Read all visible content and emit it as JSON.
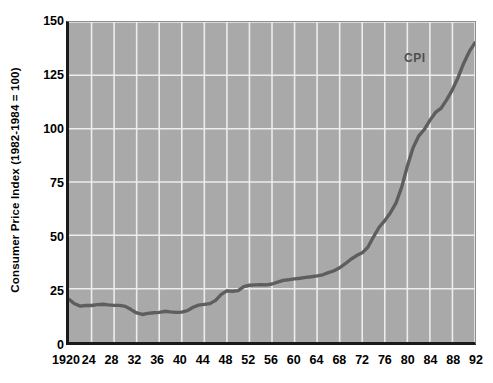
{
  "chart_data": {
    "type": "line",
    "title": "",
    "xlabel": "",
    "ylabel": "Consumer Price Index (1982-1984 = 100)",
    "xlim": [
      1920,
      1992
    ],
    "ylim": [
      0,
      150
    ],
    "grid": true,
    "legend_position": "inline-right",
    "series": [
      {
        "name": "CPI",
        "color": "#5e5e5e",
        "x": [
          1920,
          1921,
          1922,
          1923,
          1924,
          1925,
          1926,
          1927,
          1928,
          1929,
          1930,
          1931,
          1932,
          1933,
          1934,
          1935,
          1936,
          1937,
          1938,
          1939,
          1940,
          1941,
          1942,
          1943,
          1944,
          1945,
          1946,
          1947,
          1948,
          1949,
          1950,
          1951,
          1952,
          1953,
          1954,
          1955,
          1956,
          1957,
          1958,
          1959,
          1960,
          1961,
          1962,
          1963,
          1964,
          1965,
          1966,
          1967,
          1968,
          1969,
          1970,
          1971,
          1972,
          1973,
          1974,
          1975,
          1976,
          1977,
          1978,
          1979,
          1980,
          1981,
          1982,
          1983,
          1984,
          1985,
          1986,
          1987,
          1988,
          1989,
          1990,
          1991,
          1992
        ],
        "values": [
          20.0,
          17.9,
          16.8,
          17.1,
          17.1,
          17.5,
          17.7,
          17.4,
          17.2,
          17.2,
          16.7,
          15.2,
          13.6,
          12.9,
          13.4,
          13.7,
          13.9,
          14.4,
          14.1,
          13.9,
          14.0,
          14.7,
          16.3,
          17.3,
          17.6,
          18.0,
          19.5,
          22.3,
          24.0,
          23.8,
          24.1,
          26.0,
          26.6,
          26.8,
          26.9,
          26.8,
          27.2,
          28.1,
          28.9,
          29.2,
          29.6,
          29.9,
          30.3,
          30.6,
          31.0,
          31.5,
          32.5,
          33.4,
          34.8,
          36.7,
          38.8,
          40.5,
          41.8,
          44.4,
          49.3,
          53.8,
          56.9,
          60.6,
          65.2,
          72.6,
          82.4,
          90.9,
          96.5,
          99.6,
          103.9,
          107.6,
          109.6,
          113.6,
          118.3,
          124.0,
          130.7,
          136.2,
          140.3
        ]
      }
    ],
    "ytick_labels": [
      "0",
      "25",
      "50",
      "75",
      "100",
      "125",
      "150"
    ],
    "ytick_values": [
      0,
      25,
      50,
      75,
      100,
      125,
      150
    ],
    "xtick_labels": [
      "1920",
      "24",
      "28",
      "32",
      "36",
      "40",
      "44",
      "48",
      "52",
      "56",
      "60",
      "64",
      "68",
      "72",
      "76",
      "80",
      "84",
      "88",
      "92"
    ],
    "xtick_values": [
      1920,
      1924,
      1928,
      1932,
      1936,
      1940,
      1944,
      1948,
      1952,
      1956,
      1960,
      1964,
      1968,
      1972,
      1976,
      1980,
      1984,
      1988,
      1992
    ],
    "annotations": [
      {
        "text": "CPI",
        "x": 1982,
        "y": 133
      }
    ],
    "colors": {
      "plot_background": "#a9a9a9",
      "gridline": "#ededed",
      "axis": "#1a1a1a",
      "line": "#5e5e5e",
      "page_background": "#ffffff",
      "text": "#000000",
      "annotation": "#4f4f4f"
    }
  }
}
